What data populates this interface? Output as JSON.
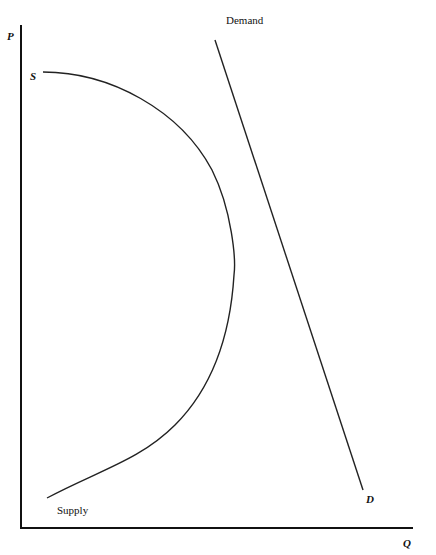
{
  "diagram": {
    "type": "supply-demand",
    "axes": {
      "y_label": "P",
      "x_label": "Q"
    },
    "curves": {
      "supply": {
        "start_label": "S",
        "end_label": "Supply",
        "shape": "backward-bending"
      },
      "demand": {
        "start_label": "Demand",
        "end_label": "D",
        "shape": "downward-sloping straight line"
      }
    },
    "colors": {
      "line": "#222222",
      "background": "#ffffff"
    }
  }
}
